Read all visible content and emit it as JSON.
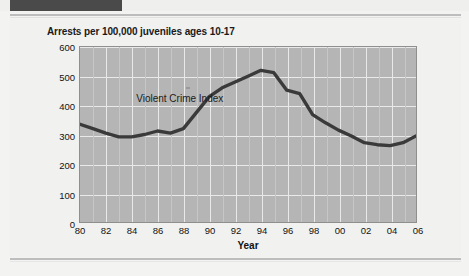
{
  "banner": {
    "text": ""
  },
  "figure": {
    "title": "Arrests per 100,000 juveniles ages 10-17"
  },
  "chart_data": {
    "type": "line",
    "title": "Arrests per 100,000 juveniles ages 10-17",
    "xlabel": "Year",
    "ylabel": "",
    "xlim": [
      1980,
      2006
    ],
    "ylim": [
      0,
      600
    ],
    "yticks": [
      0,
      100,
      200,
      300,
      400,
      500,
      600
    ],
    "ytick_labels": [
      "0",
      "100",
      "200",
      "300",
      "400",
      "500",
      "600"
    ],
    "xticks": [
      1980,
      1982,
      1984,
      1986,
      1988,
      1990,
      1992,
      1994,
      1996,
      1998,
      2000,
      2002,
      2004,
      2006
    ],
    "xtick_labels": [
      "80",
      "82",
      "84",
      "86",
      "88",
      "90",
      "92",
      "94",
      "96",
      "98",
      "00",
      "02",
      "04",
      "06"
    ],
    "grid": true,
    "legend": "none",
    "annotations": [
      {
        "text": "Violent Crime Index",
        "x": 1984.4,
        "y": 420
      }
    ],
    "series": [
      {
        "name": "Violent Crime Index",
        "color": "#3a3a3a",
        "x": [
          1980,
          1981,
          1982,
          1983,
          1984,
          1985,
          1986,
          1987,
          1988,
          1989,
          1990,
          1991,
          1992,
          1993,
          1994,
          1995,
          1996,
          1997,
          1998,
          1999,
          2000,
          2001,
          2002,
          2003,
          2004,
          2005,
          2006
        ],
        "values": [
          335,
          320,
          305,
          292,
          292,
          300,
          312,
          305,
          320,
          375,
          430,
          460,
          480,
          500,
          520,
          512,
          452,
          440,
          368,
          340,
          315,
          295,
          272,
          265,
          262,
          272,
          295
        ]
      }
    ]
  }
}
